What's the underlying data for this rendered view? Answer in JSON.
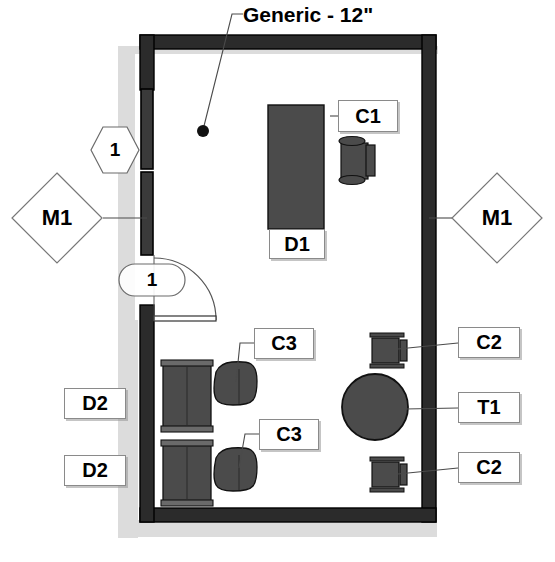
{
  "drawing": {
    "title_note": "Generic - 12\"",
    "background_color": "#ffffff",
    "wall_color": "#2b2b2b",
    "furniture_color": "#4a4a4a",
    "shadow_color": "#d9d9d9",
    "label_border_color": "#8a8a8a"
  },
  "annotations": {
    "leader_note": {
      "text": "Generic - 12\"",
      "x": 243,
      "y": 5
    },
    "hex_marker": {
      "label": "1",
      "shape": "hexagon",
      "x": 90,
      "y": 127
    },
    "door_marker": {
      "label": "1",
      "shape": "oval",
      "x": 119,
      "y": 264
    }
  },
  "wall_tags": [
    {
      "id": "m1-left",
      "label": "M1",
      "shape": "diamond",
      "x": 12,
      "y": 173,
      "w": 90,
      "h": 90
    },
    {
      "id": "m1-right",
      "label": "M1",
      "shape": "diamond",
      "x": 452,
      "y": 173,
      "w": 90,
      "h": 90
    }
  ],
  "furniture_labels": [
    {
      "id": "c1",
      "label": "C1",
      "x": 338,
      "y": 100,
      "w": 60,
      "h": 32
    },
    {
      "id": "d1",
      "label": "D1",
      "x": 269,
      "y": 229,
      "w": 56,
      "h": 30
    },
    {
      "id": "c3-upper",
      "label": "C3",
      "x": 254,
      "y": 328,
      "w": 60,
      "h": 31
    },
    {
      "id": "c3-lower",
      "label": "C3",
      "x": 259,
      "y": 419,
      "w": 60,
      "h": 31
    },
    {
      "id": "c2-upper",
      "label": "C2",
      "x": 458,
      "y": 327,
      "w": 62,
      "h": 31
    },
    {
      "id": "t1",
      "label": "T1",
      "x": 458,
      "y": 392,
      "w": 62,
      "h": 31
    },
    {
      "id": "c2-lower",
      "label": "C2",
      "x": 458,
      "y": 452,
      "w": 62,
      "h": 31
    },
    {
      "id": "d2-upper",
      "label": "D2",
      "x": 64,
      "y": 388,
      "w": 62,
      "h": 31
    },
    {
      "id": "d2-lower",
      "label": "D2",
      "x": 64,
      "y": 455,
      "w": 62,
      "h": 31
    }
  ],
  "furniture_items": [
    {
      "id": "d1-desk",
      "type": "desk",
      "label": "D1"
    },
    {
      "id": "c1-chair",
      "type": "desk-chair",
      "label": "C1"
    },
    {
      "id": "c3-armchair-upper",
      "type": "armchair",
      "label": "C3"
    },
    {
      "id": "c3-armchair-lower",
      "type": "armchair",
      "label": "C3"
    },
    {
      "id": "d2-dresser-upper",
      "type": "dresser",
      "label": "D2"
    },
    {
      "id": "d2-dresser-lower",
      "type": "dresser",
      "label": "D2"
    },
    {
      "id": "c2-chair-upper",
      "type": "side-chair",
      "label": "C2"
    },
    {
      "id": "c2-chair-lower",
      "type": "side-chair",
      "label": "C2"
    },
    {
      "id": "t1-table",
      "type": "round-table",
      "label": "T1"
    }
  ]
}
